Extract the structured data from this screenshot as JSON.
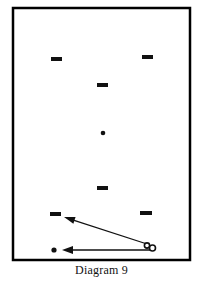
{
  "figure": {
    "caption": "Diagram 9",
    "colors": {
      "ink": "#111111",
      "background": "#ffffff",
      "frame": "#000000"
    },
    "frame": {
      "x": 13,
      "y": 8,
      "width": 177,
      "height": 252,
      "stroke_width": 2.5
    },
    "dashes": [
      {
        "id": "dash-upper-left",
        "x": 51,
        "y": 57,
        "width": 11,
        "height": 4
      },
      {
        "id": "dash-upper-right",
        "x": 142,
        "y": 55,
        "width": 11,
        "height": 4
      },
      {
        "id": "dash-upper-mid",
        "x": 97,
        "y": 83,
        "width": 11,
        "height": 4
      },
      {
        "id": "dash-lower-mid",
        "x": 97,
        "y": 186,
        "width": 11,
        "height": 4
      },
      {
        "id": "dash-lower-left",
        "x": 50,
        "y": 212,
        "width": 11,
        "height": 4
      },
      {
        "id": "dash-lower-right",
        "x": 140,
        "y": 211,
        "width": 12,
        "height": 4
      }
    ],
    "dots": [
      {
        "id": "dot-center",
        "cx": 103,
        "cy": 133,
        "r": 2.3
      },
      {
        "id": "dot-bottom-left",
        "cx": 54,
        "cy": 250,
        "r": 2.6
      }
    ],
    "circles": [
      {
        "id": "circle-ball-left",
        "cx": 147,
        "cy": 245.5,
        "r": 2.6,
        "stroke_width": 1.6
      },
      {
        "id": "circle-ball-right",
        "cx": 152.5,
        "cy": 248,
        "r": 3.0,
        "stroke_width": 1.6
      }
    ],
    "arrows": [
      {
        "id": "arrow-diagonal",
        "from_x": 147,
        "from_y": 244,
        "to_x": 64,
        "to_y": 217,
        "stroke_width": 1.3,
        "head_length": 11,
        "head_width": 7
      },
      {
        "id": "arrow-horizontal",
        "from_x": 150,
        "from_y": 250,
        "to_x": 62,
        "to_y": 250,
        "stroke_width": 1.6,
        "head_length": 11,
        "head_width": 8
      }
    ]
  }
}
